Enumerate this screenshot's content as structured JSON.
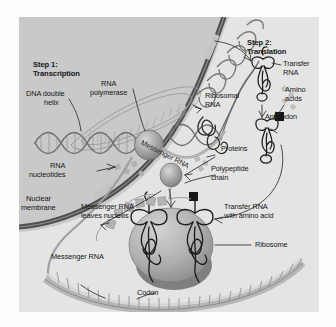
{
  "figure": {
    "type": "biology-diagram",
    "panel": {
      "background_color": "#c9c9c9",
      "cytoplasm_color": "#e3e3e3",
      "membrane_color": "#4a4a4a",
      "ink_color": "#161616"
    }
  },
  "labels": {
    "step1_line1": "Step 1:",
    "step1_line2": "Transcription",
    "step2_line1": "Step 2:",
    "step2_line2": "Translation",
    "rna_polymerase_line1": "RNA",
    "rna_polymerase_line2": "polymerase",
    "dna_helix_line1": "DNA double",
    "dna_helix_line2": "helix",
    "rna_nucleotides_line1": "RNA",
    "rna_nucleotides_line2": "nucleotides",
    "messenger_rna_membrane": "Messenger RNA",
    "nuclear_membrane_line1": "Nuclear",
    "nuclear_membrane_line2": "membrane",
    "mrna_leaves_line1": "Messenger RNA",
    "mrna_leaves_line2": "leaves nucleus",
    "messenger_rna_bottom": "Messenger RNA",
    "ribosomal_rna_line1": "Ribosomal",
    "ribosomal_rna_line2": "RNA",
    "transfer_rna_line1": "Transfer",
    "transfer_rna_line2": "RNA",
    "amino_acids_line1": "Amino",
    "amino_acids_line2": "acids",
    "anticodon": "Anticodon",
    "proteins": "Proteins",
    "polypeptide_line1": "Polypeptide",
    "polypeptide_line2": "chain",
    "trna_amino_line1": "Transfer RNA",
    "trna_amino_line2": "with amino acid",
    "ribosome": "Ribosome",
    "codon": "Codon"
  }
}
